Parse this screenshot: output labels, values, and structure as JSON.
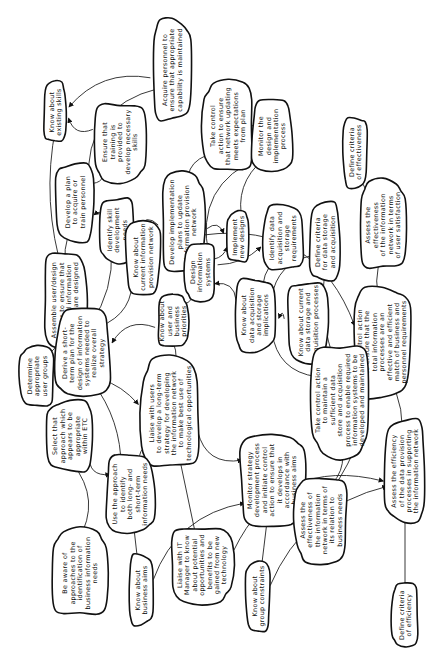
{
  "diagram": {
    "orientation": "rotated-90-ccw",
    "colors": {
      "background": "#ffffff",
      "ink": "#111111"
    },
    "nodes": [
      {
        "id": "existing-skills",
        "lines": [
          "Know about",
          "existing skills"
        ]
      },
      {
        "id": "acquire-personnel",
        "lines": [
          "Acquire personnel to",
          "ensure that appropriate",
          "capability is maintained"
        ]
      },
      {
        "id": "ensure-training",
        "lines": [
          "Ensure that",
          "training is",
          "provided to",
          "develop necessary",
          "skills"
        ]
      },
      {
        "id": "develop-plan",
        "lines": [
          "Develop a plan",
          "to acquire or",
          "train personnel"
        ]
      },
      {
        "id": "take-control-network",
        "lines": [
          "Take control",
          "action to ensure",
          "that network updating",
          "meets expectations",
          "from plan"
        ]
      },
      {
        "id": "monitor-design",
        "lines": [
          "Monitor the",
          "design and",
          "implementation",
          "process"
        ]
      },
      {
        "id": "develop-implementation",
        "lines": [
          "Develop implementation",
          "plans to update",
          "information provision",
          "network"
        ]
      },
      {
        "id": "define-criteria-effectiveness",
        "lines": [
          "Define criteria",
          "of effectiveness"
        ]
      },
      {
        "id": "identify-skill",
        "lines": [
          "Identify skill",
          "development",
          "needs"
        ]
      },
      {
        "id": "implement-designs",
        "lines": [
          "Implement",
          "new designs"
        ]
      },
      {
        "id": "identify-data-acq",
        "lines": [
          "Identify data",
          "acquisition and",
          "storage",
          "requirements"
        ]
      },
      {
        "id": "assemble-groups",
        "lines": [
          "Assemble user/design",
          "groups to ensure that",
          "required information",
          "systems are designed"
        ]
      },
      {
        "id": "know-current-network",
        "lines": [
          "Know about",
          "current information",
          "provision network"
        ]
      },
      {
        "id": "design-systems",
        "lines": [
          "Design",
          "information",
          "systems"
        ]
      },
      {
        "id": "define-criteria-storage",
        "lines": [
          "Define criteria",
          "for data storage",
          "and acquisition"
        ]
      },
      {
        "id": "assess-user-satisfaction",
        "lines": [
          "Assess the",
          "effectiveness",
          "of the information",
          "network in terms",
          "of user satisfaction"
        ]
      },
      {
        "id": "know-data-implications",
        "lines": [
          "Know about",
          "data acquisition",
          "and storage",
          "implications"
        ]
      },
      {
        "id": "know-current-data",
        "lines": [
          "Know about current",
          "data storage and",
          "acquisition processes"
        ]
      },
      {
        "id": "determine-user-groups",
        "lines": [
          "Determine",
          "appropriate",
          "user groups"
        ]
      },
      {
        "id": "derive-short-term",
        "lines": [
          "Derive a short-",
          "term plan for the",
          "design of information",
          "systems needed to",
          "realize overall",
          "strategy"
        ]
      },
      {
        "id": "know-user-priorities",
        "lines": [
          "Know about",
          "user and",
          "business",
          "priorities"
        ]
      },
      {
        "id": "take-control-total",
        "lines": [
          "Take control action",
          "to ensure that the",
          "total information",
          "processes are an",
          "effective and efficient",
          "match of business and",
          "personnel requirements"
        ]
      },
      {
        "id": "take-control-data-store",
        "lines": [
          "Take control action",
          "to maintain a",
          "sufficient data",
          "store and acquisition",
          "process to enable required",
          "information systems to be",
          "developed and maintained"
        ]
      },
      {
        "id": "select-approach",
        "lines": [
          "Select that",
          "approach which",
          "appears to be",
          "appropriate",
          "within ETC"
        ]
      },
      {
        "id": "liaise-users",
        "lines": [
          "Liaise with users",
          "to develop a long-term",
          "strategy for developing",
          "the information network",
          "to make best use of",
          "technological opportunities"
        ]
      },
      {
        "id": "use-approach",
        "lines": [
          "Use the approach",
          "to identify",
          "both long- and",
          "short-term",
          "information needs"
        ]
      },
      {
        "id": "monitor-strategy",
        "lines": [
          "Monitor strategy",
          "development process",
          "and initiate control",
          "action to ensure that",
          "it develops in",
          "accordance with",
          "business aims"
        ]
      },
      {
        "id": "assess-business-needs",
        "lines": [
          "Assess the",
          "effectiveness of",
          "the information",
          "network in terms of",
          "its relation to",
          "business needs"
        ]
      },
      {
        "id": "assess-efficiency",
        "lines": [
          "Assess the efficiency",
          "of the data provision",
          "processes in supporting",
          "the information network"
        ]
      },
      {
        "id": "be-aware",
        "lines": [
          "Be aware of",
          "approaches to the",
          "identification of",
          "business information",
          "needs"
        ]
      },
      {
        "id": "know-business-aims",
        "lines": [
          "Know about",
          "business aims"
        ]
      },
      {
        "id": "liaise-it-manager",
        "lines": [
          "Liaise with IT",
          "Manager to know",
          "about potential",
          "opportunities and",
          "benefits to be",
          "gained from new",
          "technology"
        ]
      },
      {
        "id": "know-group-constraints",
        "lines": [
          "Know about",
          "group constraints"
        ]
      },
      {
        "id": "define-criteria-efficiency",
        "lines": [
          "Define criteria",
          "of efficiency"
        ]
      }
    ]
  }
}
